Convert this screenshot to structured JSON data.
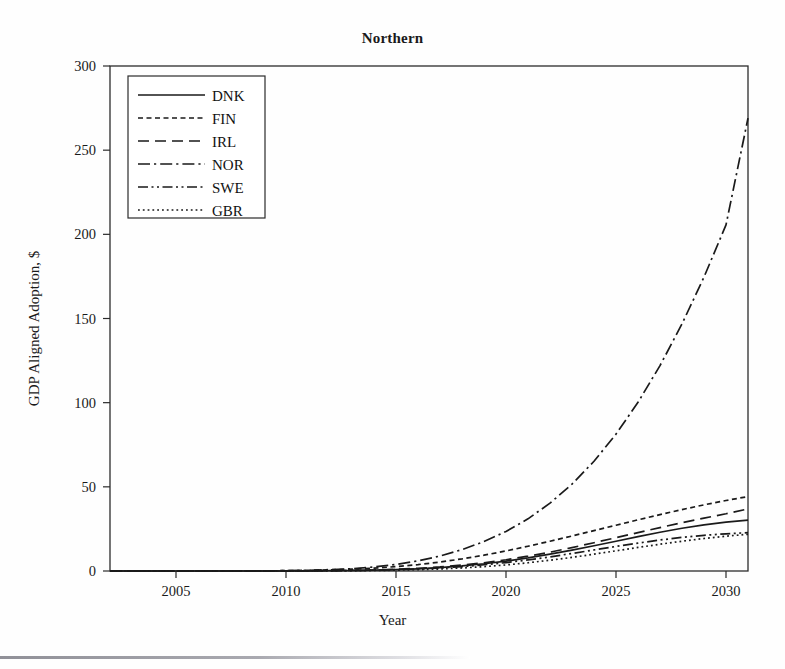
{
  "chart_data": {
    "type": "line",
    "title": "Northern",
    "xlabel": "Year",
    "ylabel": "GDP Aligned Adoption, $",
    "xlim": [
      2002,
      2031
    ],
    "ylim": [
      0,
      300
    ],
    "xticks": [
      2005,
      2010,
      2015,
      2020,
      2025,
      2030
    ],
    "yticks": [
      0,
      50,
      100,
      150,
      200,
      250,
      300
    ],
    "grid": false,
    "legend_position": "upper-left",
    "x": [
      2002,
      2003,
      2004,
      2005,
      2006,
      2007,
      2008,
      2009,
      2010,
      2011,
      2012,
      2013,
      2014,
      2015,
      2016,
      2017,
      2018,
      2019,
      2020,
      2021,
      2022,
      2023,
      2024,
      2025,
      2026,
      2027,
      2028,
      2029,
      2030,
      2031
    ],
    "series": [
      {
        "name": "DNK",
        "style": "solid",
        "values": [
          0,
          0,
          0,
          0,
          0,
          0,
          0,
          0,
          0,
          0.1,
          0.2,
          0.3,
          0.5,
          0.8,
          1.3,
          2.0,
          3.0,
          4.3,
          5.9,
          7.8,
          10.0,
          12.4,
          15.0,
          17.7,
          20.4,
          23.0,
          25.4,
          27.4,
          29.0,
          30.2
        ]
      },
      {
        "name": "FIN",
        "style": "dashed-short",
        "values": [
          0,
          0,
          0,
          0,
          0,
          0,
          0.1,
          0.1,
          0.2,
          0.4,
          0.7,
          1.1,
          1.7,
          2.6,
          3.8,
          5.3,
          7.2,
          9.4,
          11.9,
          14.7,
          17.7,
          20.8,
          24.0,
          27.2,
          30.4,
          33.5,
          36.5,
          39.3,
          41.9,
          44.2
        ]
      },
      {
        "name": "IRL",
        "style": "dashed-long",
        "values": [
          0,
          0,
          0,
          0,
          0,
          0,
          0,
          0,
          0.1,
          0.1,
          0.2,
          0.4,
          0.6,
          1.0,
          1.6,
          2.4,
          3.5,
          4.9,
          6.7,
          8.8,
          11.2,
          13.9,
          16.8,
          19.8,
          22.8,
          25.8,
          28.7,
          31.4,
          34.0,
          36.9
        ]
      },
      {
        "name": "NOR",
        "style": "dash-dot",
        "values": [
          0,
          0,
          0,
          0,
          0,
          0,
          0,
          0.1,
          0.2,
          0.4,
          0.8,
          1.4,
          2.4,
          3.9,
          6.0,
          8.9,
          12.7,
          17.5,
          23.5,
          31.0,
          40.3,
          51.6,
          65.2,
          81.3,
          100.2,
          122.0,
          146.8,
          174.6,
          205.6,
          269.0
        ]
      },
      {
        "name": "SWE",
        "style": "dash-dot-dot",
        "values": [
          0,
          0,
          0,
          0,
          0,
          0,
          0,
          0,
          0,
          0.1,
          0.2,
          0.3,
          0.5,
          0.8,
          1.2,
          1.8,
          2.6,
          3.7,
          5.0,
          6.6,
          8.4,
          10.4,
          12.5,
          14.6,
          16.6,
          18.4,
          20.0,
          21.2,
          22.1,
          22.8
        ]
      },
      {
        "name": "GBR",
        "style": "dotted",
        "values": [
          0,
          0,
          0,
          0,
          0,
          0,
          0,
          0,
          0,
          0,
          0.1,
          0.2,
          0.3,
          0.5,
          0.8,
          1.2,
          1.8,
          2.6,
          3.6,
          4.9,
          6.4,
          8.1,
          10.0,
          12.0,
          14.0,
          15.9,
          17.7,
          19.3,
          20.7,
          21.8
        ]
      }
    ],
    "legend": [
      "DNK",
      "FIN",
      "IRL",
      "NOR",
      "SWE",
      "GBR"
    ],
    "line_color": "#1a1a1a"
  }
}
